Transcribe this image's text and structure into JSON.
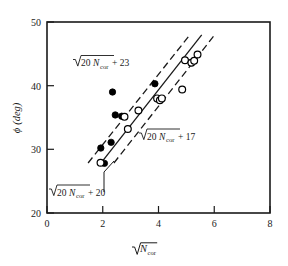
{
  "chart_data": {
    "type": "scatter",
    "title": "",
    "xlabel": "√N_cor",
    "ylabel": "ϕ (deg)",
    "xlim": [
      0,
      8
    ],
    "ylim": [
      20,
      50
    ],
    "xticks": [
      "0",
      "2",
      "4",
      "6",
      "8"
    ],
    "xtick_values": [
      0,
      2,
      4,
      6,
      8
    ],
    "yticks": [
      "20",
      "30",
      "40",
      "50"
    ],
    "ytick_values": [
      20,
      30,
      40,
      50
    ],
    "grid": false,
    "legend": "none",
    "series": [
      {
        "name": "filled-circles",
        "marker": "filled-circle",
        "points": [
          [
            1.93,
            30.2
          ],
          [
            2.06,
            27.8
          ],
          [
            2.3,
            31.1
          ],
          [
            2.35,
            39.0
          ],
          [
            2.45,
            35.4
          ],
          [
            2.68,
            35.2
          ],
          [
            3.87,
            40.3
          ]
        ]
      },
      {
        "name": "open-circles",
        "marker": "open-circle",
        "points": [
          [
            1.92,
            27.9
          ],
          [
            2.78,
            35.1
          ],
          [
            2.9,
            33.2
          ],
          [
            3.28,
            36.1
          ],
          [
            3.95,
            38.0
          ],
          [
            4.05,
            37.7
          ],
          [
            4.12,
            38.0
          ],
          [
            4.85,
            39.4
          ],
          [
            4.95,
            44.0
          ],
          [
            5.18,
            43.6
          ],
          [
            5.28,
            43.9
          ],
          [
            5.4,
            44.9
          ]
        ]
      }
    ],
    "lines": [
      {
        "name": "upper-bound",
        "style": "dashed",
        "label": "√(20 N_cor) + 23",
        "intercept": 23,
        "coefficient": 20,
        "x_from": 1.45,
        "x_to": 5.05
      },
      {
        "name": "center-fit",
        "style": "solid",
        "label": "√(20 N_cor) + 20",
        "intercept": 20,
        "coefficient": 20,
        "x_from": 1.9,
        "x_to": 5.55
      },
      {
        "name": "lower-bound",
        "style": "dashed",
        "label": "√(20 N_cor) + 17",
        "intercept": 17,
        "coefficient": 20,
        "x_from": 2.15,
        "x_to": 6.0
      }
    ],
    "annotations": [
      {
        "name": "upper-label",
        "radicand_prefix": "20",
        "radicand_var": "N",
        "radicand_sub": "cor",
        "offset": "+ 23"
      },
      {
        "name": "middle-label",
        "radicand_prefix": "20",
        "radicand_var": "N",
        "radicand_sub": "cor",
        "offset": "+ 17"
      },
      {
        "name": "lower-label",
        "radicand_prefix": "20",
        "radicand_var": "N",
        "radicand_sub": "cor",
        "offset": "+ 20"
      }
    ]
  },
  "axis": {
    "y_label_symbol": "ϕ",
    "y_label_unit": "(deg)",
    "x_label_var": "N",
    "x_label_sub": "cor"
  },
  "colors": {
    "axis": "#1a1a1a",
    "marker_fill": "#000000",
    "marker_open": "#ffffff",
    "background": "#ffffff"
  }
}
